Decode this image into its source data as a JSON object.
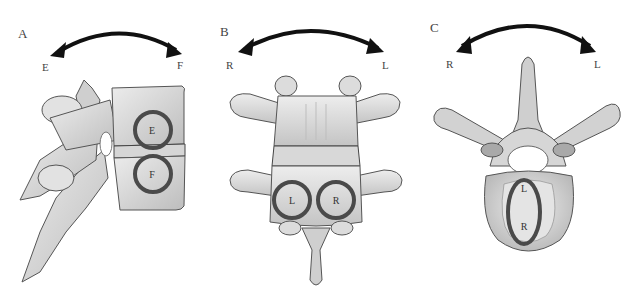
{
  "figure": {
    "panels": [
      {
        "id": "A",
        "letter": "A",
        "view": "lateral",
        "arrow": {
          "left_label": "E",
          "right_label": "F",
          "type": "double-headed-curved"
        },
        "circles": [
          {
            "label": "E",
            "position": "upper"
          },
          {
            "label": "F",
            "position": "lower"
          }
        ]
      },
      {
        "id": "B",
        "letter": "B",
        "view": "anterior",
        "arrow": {
          "left_label": "R",
          "right_label": "L",
          "type": "double-headed-curved"
        },
        "circles": [
          {
            "label": "L",
            "position": "left"
          },
          {
            "label": "R",
            "position": "right"
          }
        ]
      },
      {
        "id": "C",
        "letter": "C",
        "view": "superior",
        "arrow": {
          "left_label": "R",
          "right_label": "L",
          "type": "double-headed-curved"
        },
        "circles": [
          {
            "label_top": "L",
            "label_bottom": "R",
            "shape": "ellipse"
          }
        ]
      }
    ],
    "colors": {
      "arrow": "#111111",
      "circle_outline": "#4a4a4a",
      "bone_fill": "#d9d9d9",
      "bone_shadow": "#a8a8a8",
      "bone_outline": "#555555",
      "background": "#ffffff"
    }
  }
}
